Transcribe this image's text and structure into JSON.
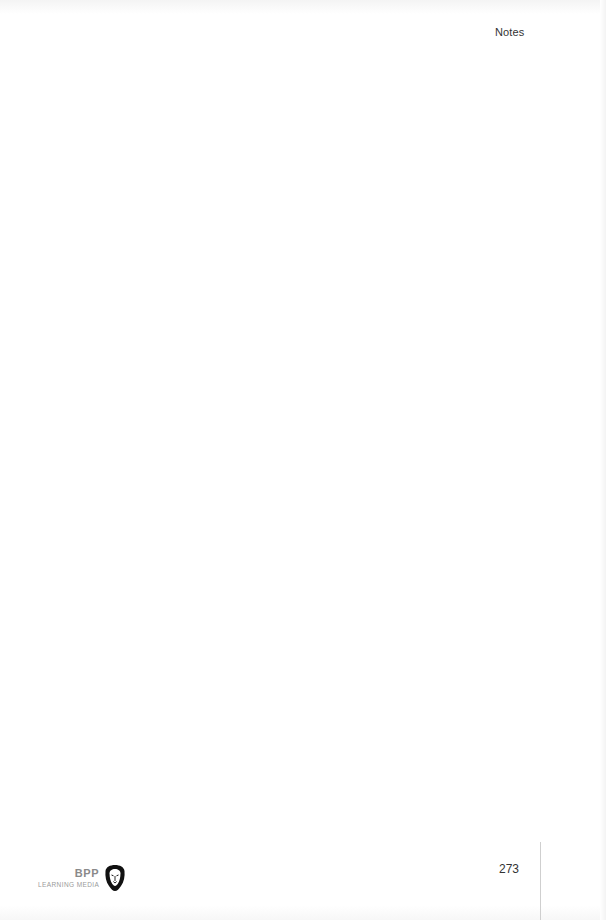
{
  "header": {
    "section_label": "Notes"
  },
  "footer": {
    "page_number": "273",
    "logo": {
      "brand": "BPP",
      "subtitle": "LEARNING MEDIA",
      "icon": "lion-shield-icon"
    }
  },
  "colors": {
    "text": "#333333",
    "logo_text": "#8a8a8a",
    "logo_icon": "#111111",
    "rule": "#cfcfcf"
  }
}
